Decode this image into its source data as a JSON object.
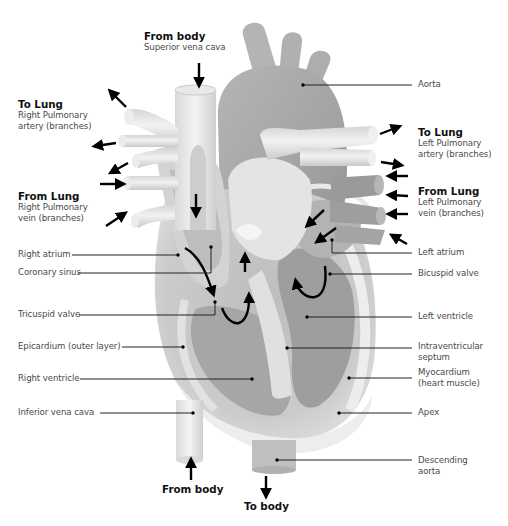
{
  "diagram": {
    "colors": {
      "background": "#ffffff",
      "tissue_light": "#e6e6e6",
      "tissue_mid": "#c4c4c4",
      "tissue_dark": "#9a9a9a",
      "aorta": "#a9a9a9",
      "leader_line": "#222222",
      "arrow": "#000000",
      "label_text": "#4a4a4a",
      "heading_text": "#111111"
    },
    "flow_labels": {
      "top_from_body": {
        "heading": "From body",
        "sub": "Superior vena cava"
      },
      "right_to_lung": {
        "heading": "To Lung",
        "sub1": "Right Pulmonary",
        "sub2": "artery (branches)"
      },
      "right_from_lung": {
        "heading": "From Lung",
        "sub1": "Right Pulmonary",
        "sub2": "vein (branches)"
      },
      "left_to_lung": {
        "heading": "To Lung",
        "sub1": "Left Pulmonary",
        "sub2": "artery (branches)"
      },
      "left_from_lung": {
        "heading": "From Lung",
        "sub1": "Left Pulmonary",
        "sub2": "vein (branches)"
      },
      "bottom_from_body": {
        "heading": "From body"
      },
      "bottom_to_body": {
        "heading": "To body"
      }
    },
    "left_labels": [
      "Right atrium",
      "Coronary sinus",
      "Tricuspid valve",
      "Epicardium (outer layer)",
      "Right ventricle",
      "Inferior vena cava"
    ],
    "right_labels": {
      "aorta": "Aorta",
      "left_atrium": "Left atrium",
      "bicuspid_valve": "Bicuspid valve",
      "left_ventricle": "Left ventricle",
      "septum_1": "Intraventricular",
      "septum_2": "septum",
      "myocardium_1": "Myocardium",
      "myocardium_2": "(heart muscle)",
      "apex": "Apex",
      "descending_aorta_1": "Descending",
      "descending_aorta_2": "aorta"
    }
  }
}
